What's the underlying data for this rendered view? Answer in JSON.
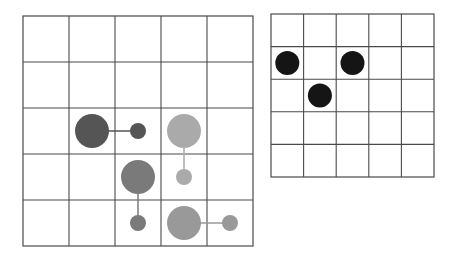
{
  "colors": {
    "grid_line": "#4a4a4a",
    "background": "#ffffff",
    "dark_gray": "#555555",
    "mid_gray": "#7a7a7a",
    "light_gray": "#aaaaaa",
    "medium_light_gray": "#999999",
    "black": "#151515"
  },
  "left_grid": {
    "rows": 5,
    "cols": 5,
    "x": 23,
    "y": 16,
    "cell": 46,
    "pairs": [
      {
        "name": "dark-pair",
        "color": "dark_gray",
        "big": {
          "row": 2,
          "col": 1,
          "r": 17
        },
        "small": {
          "row": 2,
          "col": 2,
          "r": 8
        }
      },
      {
        "name": "light-pair",
        "color": "light_gray",
        "big": {
          "row": 2,
          "col": 3,
          "r": 17
        },
        "small": {
          "row": 3,
          "col": 3,
          "r": 8
        }
      },
      {
        "name": "mid-pair",
        "color": "mid_gray",
        "big": {
          "row": 3,
          "col": 2,
          "r": 17
        },
        "small": {
          "row": 4,
          "col": 2,
          "r": 8
        }
      },
      {
        "name": "medium-light-pair",
        "color": "medium_light_gray",
        "big": {
          "row": 4,
          "col": 3,
          "r": 17
        },
        "small": {
          "row": 4,
          "col": 4,
          "r": 8
        }
      }
    ]
  },
  "right_grid": {
    "rows": 5,
    "cols": 5,
    "x": 271,
    "y": 14,
    "cell": 32.6,
    "dots": [
      {
        "row": 1,
        "col": 0,
        "r": 12
      },
      {
        "row": 1,
        "col": 2,
        "r": 12
      },
      {
        "row": 2,
        "col": 1,
        "r": 12
      }
    ]
  }
}
